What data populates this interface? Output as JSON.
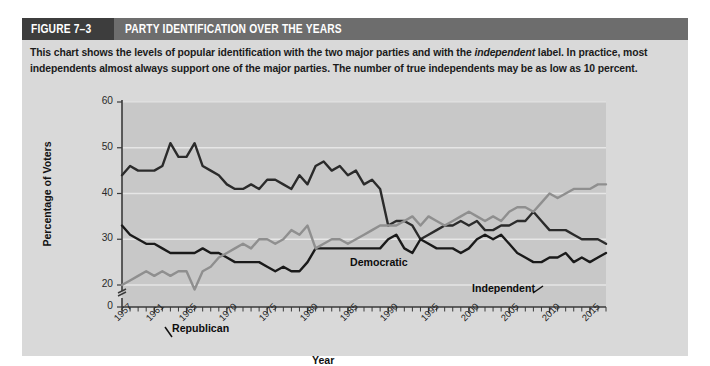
{
  "figure": {
    "number": "FIGURE 7–3",
    "title": "PARTY IDENTIFICATION OVER THE YEARS",
    "caption_part1": "This chart shows the levels of popular identification with the two major parties and with the ",
    "caption_italic": "independent",
    "caption_part2": " label. In practice, most independents almost always support one of the major parties. The number of true independents may be as low as 10 percent."
  },
  "colors": {
    "header_bar": "#6d6d6d",
    "header_number_box": "#3d3d3d",
    "panel_background": "#d9d9d9",
    "plot_background": "#c8c8c8",
    "gridline": "#e8e8e8",
    "democratic": "#2b2b2b",
    "republican": "#1a1a1a",
    "independent": "#8f8f8f"
  },
  "chart_data": {
    "type": "line",
    "title": "PARTY IDENTIFICATION OVER THE YEARS",
    "xlabel": "Year",
    "ylabel": "Percentage of Voters",
    "xlim": [
      1957,
      2017
    ],
    "ylim": [
      0,
      60
    ],
    "y_axis_break": true,
    "y_break_between": [
      0,
      20
    ],
    "yticks": [
      0,
      20,
      30,
      40,
      50,
      60
    ],
    "xticks": [
      1957,
      1961,
      1965,
      1970,
      1975,
      1980,
      1985,
      1990,
      1995,
      2000,
      2005,
      2010,
      2015
    ],
    "xtick_labels": [
      "1957",
      "1961",
      "1965",
      "1970",
      "1975",
      "1980",
      "1985",
      "1990",
      "1995",
      "2000",
      "2005",
      "2010",
      "2015"
    ],
    "ytick_labels": [
      "0",
      "20",
      "30",
      "40",
      "50",
      "60"
    ],
    "minor_tick_interval": 1,
    "grid": true,
    "grid_axis": "y",
    "legend": "inline-labels",
    "x": [
      1957,
      1958,
      1959,
      1960,
      1961,
      1962,
      1963,
      1964,
      1965,
      1966,
      1967,
      1968,
      1969,
      1970,
      1971,
      1972,
      1973,
      1974,
      1975,
      1976,
      1977,
      1978,
      1979,
      1980,
      1981,
      1982,
      1983,
      1984,
      1985,
      1986,
      1987,
      1988,
      1989,
      1990,
      1991,
      1992,
      1993,
      1994,
      1995,
      1996,
      1997,
      1998,
      1999,
      2000,
      2001,
      2002,
      2003,
      2004,
      2005,
      2006,
      2007,
      2008,
      2009,
      2010,
      2011,
      2012,
      2013,
      2014,
      2015,
      2016,
      2017
    ],
    "series": [
      {
        "name": "Democratic",
        "color": "#2b2b2b",
        "label_x": 1984,
        "label_y": 47,
        "values": [
          44,
          46,
          45,
          45,
          45,
          46,
          51,
          48,
          48,
          51,
          46,
          45,
          44,
          42,
          41,
          41,
          42,
          41,
          43,
          43,
          42,
          41,
          44,
          42,
          46,
          47,
          45,
          46,
          44,
          45,
          42,
          43,
          41,
          33,
          34,
          34,
          33,
          30,
          31,
          32,
          33,
          33,
          34,
          33,
          34,
          32,
          32,
          33,
          33,
          34,
          34,
          36,
          34,
          32,
          32,
          32,
          31,
          30,
          30,
          30,
          29
        ]
      },
      {
        "name": "Republican",
        "color": "#1a1a1a",
        "label_x": 1961,
        "label_y": 33,
        "values": [
          33,
          31,
          30,
          29,
          29,
          28,
          27,
          27,
          27,
          27,
          28,
          27,
          27,
          26,
          25,
          25,
          25,
          25,
          24,
          23,
          24,
          23,
          23,
          25,
          28,
          28,
          28,
          28,
          28,
          28,
          28,
          28,
          28,
          30,
          31,
          28,
          27,
          30,
          29,
          28,
          28,
          28,
          27,
          28,
          30,
          31,
          30,
          31,
          29,
          27,
          26,
          25,
          25,
          26,
          26,
          27,
          25,
          26,
          25,
          26,
          27
        ]
      },
      {
        "name": "Independent",
        "color": "#8f8f8f",
        "label_x": 2008,
        "label_y": 44,
        "values": [
          20,
          21,
          22,
          23,
          22,
          23,
          22,
          23,
          23,
          19,
          23,
          24,
          26,
          27,
          28,
          29,
          28,
          30,
          30,
          29,
          30,
          32,
          31,
          33,
          28,
          29,
          30,
          30,
          29,
          30,
          31,
          32,
          33,
          33,
          33,
          34,
          35,
          33,
          35,
          34,
          33,
          34,
          35,
          36,
          35,
          34,
          35,
          34,
          36,
          37,
          37,
          36,
          38,
          40,
          39,
          40,
          41,
          41,
          41,
          42,
          42
        ]
      }
    ]
  }
}
